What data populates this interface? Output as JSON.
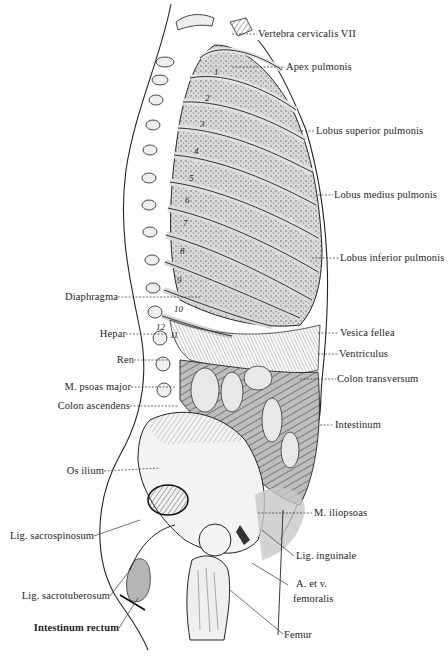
{
  "figure": {
    "type": "anatomical illustration",
    "colors": {
      "ink": "#1e1e1e",
      "paper": "#ffffff",
      "shade": "#9a9a9a",
      "tint": "#c8c8c8"
    }
  },
  "labels_right": [
    {
      "text": "Vertebra cervicalis VII",
      "x": 258,
      "y": 30
    },
    {
      "text": "Apex pulmonis",
      "x": 286,
      "y": 63
    },
    {
      "text": "Lobus superior pulmonis",
      "x": 316,
      "y": 126
    },
    {
      "text": "Lobus medius pulmonis",
      "x": 334,
      "y": 190
    },
    {
      "text": "Lobus inferior pulmonis",
      "x": 340,
      "y": 253
    },
    {
      "text": "Vesica fellea",
      "x": 340,
      "y": 328
    },
    {
      "text": "Ventriculus",
      "x": 339,
      "y": 349
    },
    {
      "text": "Colon transversum",
      "x": 337,
      "y": 374
    },
    {
      "text": "Intestinum",
      "x": 335,
      "y": 420
    },
    {
      "text": "M. iliopsoas",
      "x": 314,
      "y": 508
    },
    {
      "text": "Lig. inguinale",
      "x": 296,
      "y": 551
    },
    {
      "text": "A. et v.",
      "x": 296,
      "y": 580
    },
    {
      "text": "femoralis",
      "x": 293,
      "y": 594
    },
    {
      "text": "Femur",
      "x": 284,
      "y": 630
    }
  ],
  "labels_left": [
    {
      "text": "Diaphragma",
      "right": 118,
      "y": 292
    },
    {
      "text": "Hepar",
      "right": 126,
      "y": 329
    },
    {
      "text": "Ren",
      "right": 134,
      "y": 355
    },
    {
      "text": "M. psoas major",
      "right": 131,
      "y": 382
    },
    {
      "text": "Colon ascendens",
      "right": 130,
      "y": 401
    },
    {
      "text": "Os ilium",
      "right": 104,
      "y": 466
    },
    {
      "text": "Lig. sacrospinosum",
      "right": 94,
      "y": 531
    },
    {
      "text": "Lig. sacrotuberosum",
      "right": 110,
      "y": 591
    },
    {
      "text": "Intestinum rectum",
      "right": 119,
      "y": 623,
      "bold": true
    }
  ],
  "rib_numbers": [
    {
      "n": "1",
      "x": 214,
      "y": 73
    },
    {
      "n": "2",
      "x": 205,
      "y": 99
    },
    {
      "n": "3",
      "x": 200,
      "y": 125
    },
    {
      "n": "4",
      "x": 194,
      "y": 152
    },
    {
      "n": "5",
      "x": 189,
      "y": 179
    },
    {
      "n": "6",
      "x": 185,
      "y": 201
    },
    {
      "n": "7",
      "x": 183,
      "y": 224
    },
    {
      "n": "8",
      "x": 180,
      "y": 252
    },
    {
      "n": "9",
      "x": 177,
      "y": 281
    },
    {
      "n": "10",
      "x": 174,
      "y": 310
    },
    {
      "n": "12",
      "x": 156,
      "y": 328
    },
    {
      "n": "11",
      "x": 170,
      "y": 336
    }
  ]
}
